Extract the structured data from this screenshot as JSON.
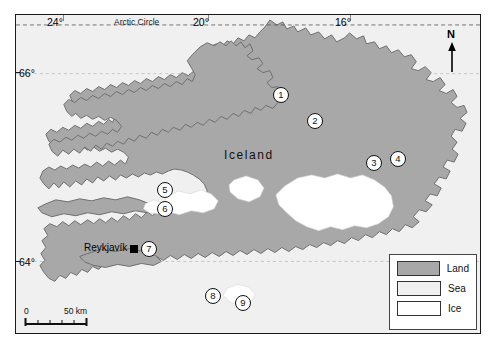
{
  "map": {
    "title": "Iceland",
    "island_label": "Iceland",
    "city": {
      "name": "Reykjavík",
      "marker": "city-square"
    },
    "graticule": {
      "arctic_circle_label": "Arctic Circle",
      "longitudes": [
        {
          "label": "24°",
          "x": 57
        },
        {
          "label": "20°",
          "x": 203
        },
        {
          "label": "16°",
          "x": 345
        }
      ],
      "latitudes": [
        {
          "label": "66°",
          "y": 73
        },
        {
          "label": "64°",
          "y": 262
        }
      ]
    },
    "compass": {
      "letter": "N",
      "icon": "north-arrow-icon"
    },
    "markers": [
      {
        "id": "1",
        "label": "1",
        "x": 281,
        "y": 95
      },
      {
        "id": "2",
        "label": "2",
        "x": 315,
        "y": 121
      },
      {
        "id": "3",
        "label": "3",
        "x": 374,
        "y": 163
      },
      {
        "id": "4",
        "label": "4",
        "x": 398,
        "y": 159
      },
      {
        "id": "5",
        "label": "5",
        "x": 165,
        "y": 190
      },
      {
        "id": "6",
        "label": "6",
        "x": 165,
        "y": 209
      },
      {
        "id": "7",
        "label": "7",
        "x": 149,
        "y": 249
      },
      {
        "id": "8",
        "label": "8",
        "x": 213,
        "y": 296
      },
      {
        "id": "9",
        "label": "9",
        "x": 243,
        "y": 303
      }
    ],
    "legend": {
      "items": [
        {
          "label": "Land",
          "color": "#a8a8a8"
        },
        {
          "label": "Sea",
          "color": "#f0f0f0"
        },
        {
          "label": "Ice",
          "color": "#ffffff"
        }
      ]
    },
    "scalebar": {
      "start_label": "0",
      "end_label": "50 km"
    },
    "colors": {
      "land": "#a8a8a8",
      "sea": "#f0f0f0",
      "ice": "#ffffff",
      "outline": "#6f6f6f",
      "frame": "#1a1a1a"
    }
  }
}
